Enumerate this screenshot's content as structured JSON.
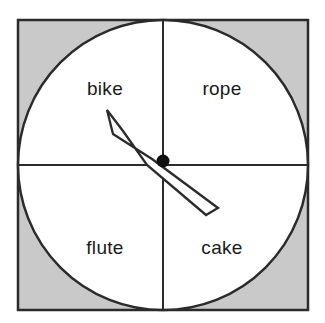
{
  "figure": {
    "type": "spinner-wheel",
    "background_color": "#ffffff",
    "board_fill": "#c9c9c9",
    "board_stroke": "#2b2b2b",
    "circle_fill": "#ffffff",
    "circle_stroke": "#2b2b2b",
    "divider_color": "#2b2b2b",
    "arrow_fill": "#ffffff",
    "arrow_stroke": "#2b2b2b",
    "pivot_color": "#111111",
    "label_color": "#1a1a1a",
    "pointing_at": "bike"
  },
  "board": {
    "x": 18,
    "y": 20,
    "width": 290,
    "height": 290
  },
  "circle": {
    "cx": 163,
    "cy": 165,
    "r": 145
  },
  "pivot": {
    "cx": 163,
    "cy": 161,
    "r": 6.5
  },
  "arrow": {
    "points": "107,110 113,134 152,159 218,208 206,215 147,165 123,131",
    "tip_x": 107,
    "tip_y": 110,
    "tail_x": 212,
    "tail_y": 212
  },
  "sections": [
    {
      "id": "bike",
      "label": "bike",
      "position": "top-left",
      "x": 105,
      "y": 95
    },
    {
      "id": "rope",
      "label": "rope",
      "position": "top-right",
      "x": 222,
      "y": 95
    },
    {
      "id": "flute",
      "label": "flute",
      "position": "bottom-left",
      "x": 105,
      "y": 254
    },
    {
      "id": "cake",
      "label": "cake",
      "position": "bottom-right",
      "x": 222,
      "y": 254
    }
  ],
  "chart_data": {
    "type": "pie",
    "title": "",
    "categories": [
      "bike",
      "rope",
      "flute",
      "cake"
    ],
    "values": [
      25,
      25,
      25,
      25
    ],
    "units": "percent",
    "legend": "none",
    "grid": false,
    "annotations": [
      "arrow points to bike"
    ]
  }
}
